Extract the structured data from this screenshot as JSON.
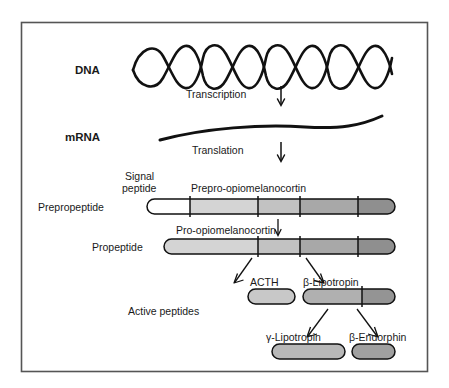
{
  "figure": {
    "frame": {
      "x": 21,
      "y": 22,
      "width": 407,
      "height": 350,
      "border_color": "#555555"
    },
    "background": "#ffffff",
    "stroke_color": "#111111"
  },
  "stages": {
    "dna_label": "DNA",
    "mrna_label": "mRNA",
    "transcription_label": "Transcription",
    "translation_label": "Translation",
    "prepropeptide_label": "Prepropeptide",
    "propeptide_label": "Propeptide",
    "active_peptides_label": "Active peptides"
  },
  "annotations": {
    "signal_peptide_line1": "Signal",
    "signal_peptide_line2": "peptide",
    "prepro_opiomelanocortin": "Prepro-opiomelanocortin",
    "pro_opiomelanocortin": "Pro-opiomelanocortin",
    "acth": "ACTH",
    "beta_lipotropin": "β-Lipotropin",
    "gamma_lipotropin": "γ-Lipotropin",
    "beta_endorphin": "β-Endorphin"
  },
  "bars": {
    "prepropeptide": {
      "x": 147,
      "y": 199,
      "width": 248,
      "height": 15,
      "segments": [
        {
          "name": "signal-peptide",
          "start": 147,
          "end": 190,
          "fill": "#ffffff"
        },
        {
          "name": "segment-acth-region",
          "start": 190,
          "end": 258,
          "fill": "#d4d4d4"
        },
        {
          "name": "segment-beta-lipotropin",
          "start": 258,
          "end": 300,
          "fill": "#c2c2c2"
        },
        {
          "name": "segment-gamma-lipotropin",
          "start": 300,
          "end": 358,
          "fill": "#a8a8a8"
        },
        {
          "name": "segment-beta-endorphin",
          "start": 358,
          "end": 395,
          "fill": "#8f8f8f"
        }
      ],
      "ticks": [
        190,
        258,
        300,
        358
      ]
    },
    "propeptide": {
      "x": 164,
      "y": 239,
      "width": 231,
      "height": 15,
      "segments": [
        {
          "name": "segment-acth-region",
          "start": 164,
          "end": 258,
          "fill": "#d4d4d4"
        },
        {
          "name": "segment-beta-lipotropin",
          "start": 258,
          "end": 300,
          "fill": "#c2c2c2"
        },
        {
          "name": "segment-gamma-lipotropin",
          "start": 300,
          "end": 358,
          "fill": "#a8a8a8"
        },
        {
          "name": "segment-beta-endorphin",
          "start": 358,
          "end": 395,
          "fill": "#8f8f8f"
        }
      ],
      "ticks": [
        258,
        300,
        358
      ]
    },
    "acth": {
      "x": 248,
      "y": 289,
      "width": 47,
      "height": 15,
      "fill": "#c8c8c8"
    },
    "beta_lipotropin": {
      "x": 303,
      "y": 289,
      "width": 92,
      "height": 15,
      "segments": [
        {
          "name": "segment-gamma-lipotropin",
          "start": 303,
          "end": 362,
          "fill": "#b0b0b0"
        },
        {
          "name": "segment-beta-endorphin",
          "start": 362,
          "end": 395,
          "fill": "#949494"
        }
      ],
      "ticks": [
        362
      ]
    },
    "gamma_lipotropin": {
      "x": 272,
      "y": 344,
      "width": 73,
      "height": 15,
      "fill": "#b8b8b8"
    },
    "beta_endorphin": {
      "x": 352,
      "y": 344,
      "width": 43,
      "height": 15,
      "fill": "#a0a0a0"
    }
  }
}
